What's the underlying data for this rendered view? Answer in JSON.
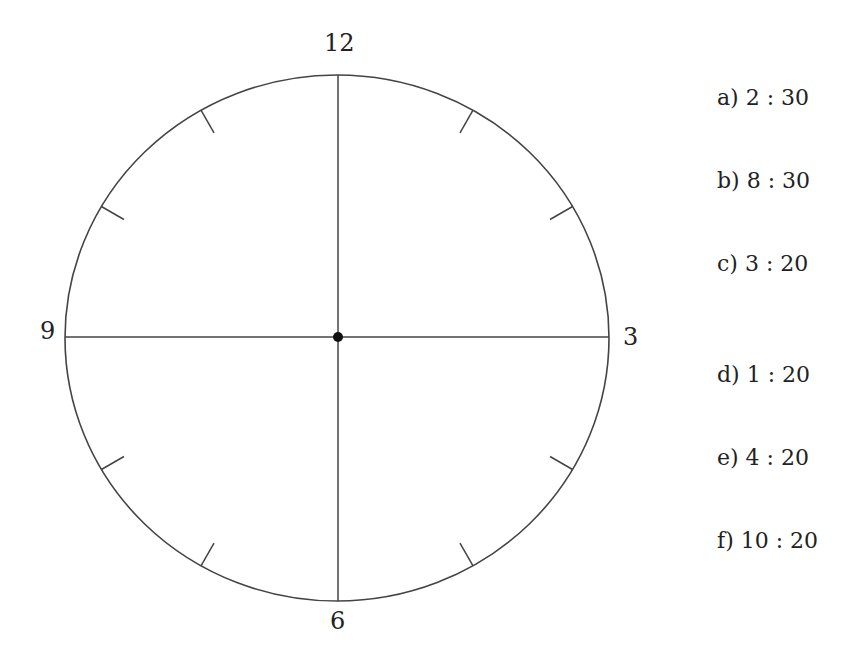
{
  "clock": {
    "numerals": {
      "top": "12",
      "right": "3",
      "bottom": "6",
      "left": "9"
    },
    "tick_marks": 8,
    "has_center_dot": true,
    "colors": {
      "stroke": "#444444",
      "dot": "#111111"
    }
  },
  "questions": [
    {
      "label": "a)",
      "time": "2 : 30"
    },
    {
      "label": "b)",
      "time": "8 : 30"
    },
    {
      "label": "c)",
      "time": "3 : 20"
    },
    {
      "label": "d)",
      "time": "1 : 20"
    },
    {
      "label": "e)",
      "time": "4 : 20"
    },
    {
      "label": "f)",
      "time": "10 : 20"
    }
  ]
}
